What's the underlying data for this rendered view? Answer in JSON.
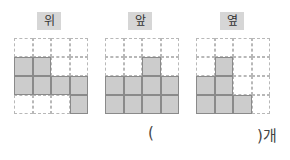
{
  "views": [
    {
      "label": "위",
      "left": 14,
      "labelLeft": 37,
      "filled": [
        [
          0,
          0,
          0,
          0
        ],
        [
          1,
          1,
          0,
          0
        ],
        [
          1,
          1,
          1,
          1
        ],
        [
          0,
          0,
          0,
          1
        ]
      ]
    },
    {
      "label": "앞",
      "left": 105,
      "labelLeft": 128,
      "filled": [
        [
          0,
          0,
          0,
          0
        ],
        [
          0,
          0,
          1,
          0
        ],
        [
          1,
          1,
          1,
          1
        ],
        [
          1,
          1,
          1,
          1
        ]
      ]
    },
    {
      "label": "옆",
      "left": 196,
      "labelLeft": 220,
      "filled": [
        [
          0,
          0,
          0,
          0
        ],
        [
          0,
          1,
          0,
          0
        ],
        [
          1,
          1,
          0,
          0
        ],
        [
          1,
          1,
          1,
          0
        ]
      ]
    }
  ],
  "answer": {
    "open": "(",
    "close": ")개",
    "value": ""
  },
  "colors": {
    "filled": "#cccccc",
    "label_bg": "#d6d6d6"
  }
}
